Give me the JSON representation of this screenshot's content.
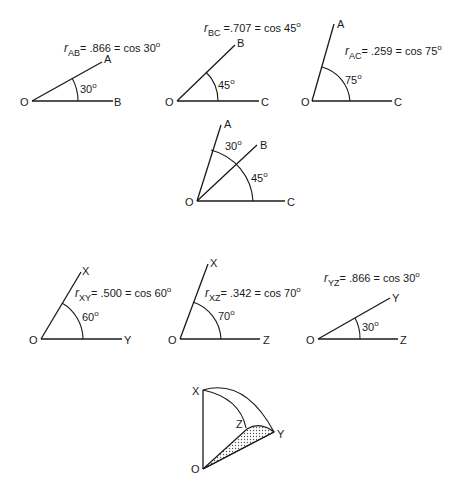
{
  "figure": {
    "panels": [
      {
        "id": "AB",
        "origin_label": "O",
        "end_labels": [
          "A",
          "B"
        ],
        "angle_label": "30",
        "degree_symbol": "o",
        "equation": {
          "r": "r",
          "subscript": "AB",
          "text": "= .866 = cos 30",
          "sup": "o"
        }
      },
      {
        "id": "BC",
        "origin_label": "O",
        "end_labels": [
          "B",
          "C"
        ],
        "angle_label": "45",
        "degree_symbol": "o",
        "equation": {
          "r": "r",
          "subscript": "BC",
          "text": " =.707 = cos 45",
          "sup": "o"
        }
      },
      {
        "id": "AC",
        "origin_label": "O",
        "end_labels": [
          "A",
          "C"
        ],
        "angle_label": "75",
        "degree_symbol": "o",
        "equation": {
          "r": "r",
          "subscript": "AC",
          "text": "= .259 = cos 75",
          "sup": "o"
        }
      },
      {
        "id": "ABC",
        "origin_label": "O",
        "end_labels": [
          "A",
          "B",
          "C"
        ],
        "angle_labels": [
          "30",
          "45"
        ],
        "degree_symbol": "o"
      },
      {
        "id": "XY",
        "origin_label": "O",
        "end_labels": [
          "X",
          "Y"
        ],
        "angle_label": "60",
        "degree_symbol": "o",
        "equation": {
          "r": "r",
          "subscript": "XY",
          "text": "= .500 = cos 60",
          "sup": "o"
        }
      },
      {
        "id": "XZ",
        "origin_label": "O",
        "end_labels": [
          "X",
          "Z"
        ],
        "angle_label": "70",
        "degree_symbol": "o",
        "equation": {
          "r": "r",
          "subscript": "XZ",
          "text": "= .342 = cos 70",
          "sup": "o"
        }
      },
      {
        "id": "YZ",
        "origin_label": "O",
        "end_labels": [
          "Y",
          "Z"
        ],
        "angle_label": "30",
        "degree_symbol": "o",
        "equation": {
          "r": "r",
          "subscript": "YZ",
          "text": "= .866 = cos 30",
          "sup": "o"
        }
      },
      {
        "id": "XYZ-sphere",
        "origin_label": "O",
        "end_labels": [
          "X",
          "Y",
          "Z"
        ],
        "shaded_region": "OZY"
      }
    ]
  }
}
